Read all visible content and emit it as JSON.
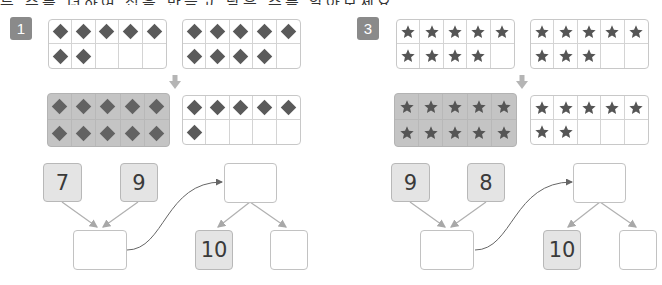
{
  "header": {
    "cut_off_instruction_text": "두 수를 더하여 십을 만들고 남은 수를 알아보세요."
  },
  "colors": {
    "badge": "#8a8a8a",
    "filled_frame": "#c4c4c4",
    "given_box": "#e4e4e4",
    "box_border": "#c2c2c2",
    "shape": "#5a5a5a"
  },
  "problems": [
    {
      "number": "1",
      "shape": "diamond",
      "frame_a_count": 7,
      "frame_b_count": 9,
      "merged_full_count": 10,
      "merged_remainder_count": 6,
      "addend_1": "7",
      "addend_2": "9",
      "sum_answer": "",
      "decomposition_top": "",
      "decomposition_tens": "10",
      "decomposition_ones": ""
    },
    {
      "number": "3",
      "shape": "star",
      "frame_a_count": 9,
      "frame_b_count": 8,
      "merged_full_count": 10,
      "merged_remainder_count": 7,
      "addend_1": "9",
      "addend_2": "8",
      "sum_answer": "",
      "decomposition_top": "",
      "decomposition_tens": "10",
      "decomposition_ones": ""
    }
  ]
}
